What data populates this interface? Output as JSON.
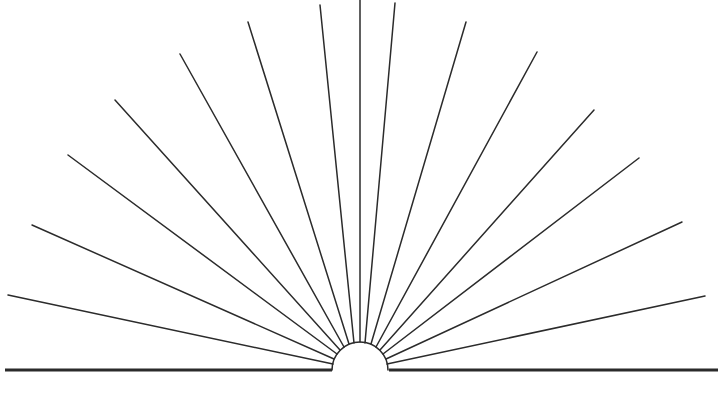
{
  "figure": {
    "name": "sunburst-fan-diagram",
    "width": 723,
    "height": 394,
    "background_color": "#ffffff",
    "stroke_color": "#2b2b2b",
    "ray_stroke_width": 1.5,
    "dome_stroke_width": 1.6,
    "baseline_stroke_width": 3.2
  },
  "baseline": {
    "label": "ground-line",
    "x_start": 5,
    "x_end": 718,
    "y": 370,
    "gap_left": 332,
    "gap_right": 389
  },
  "dome": {
    "label": "semicircle-hub",
    "center_x": 360,
    "center_y": 370,
    "radius": 28,
    "arc_start_deg": 0,
    "arc_end_deg": 180,
    "filled": false
  },
  "geometry": {
    "origin_x": 360,
    "origin_y": 370,
    "ray_count": 15,
    "angular_step_deg": 11.25,
    "angle_range_deg": [
      11.25,
      168.75
    ],
    "notes": "Rays emanate radially from the semicircle rim; outer ends are clipped by the frame."
  },
  "chart_data": {
    "type": "scatter",
    "title": "",
    "xlabel": "",
    "ylabel": "",
    "rays": [
      {
        "index": 1,
        "angle_deg": 11.25,
        "x1": 387,
        "y1": 364,
        "x2": 705,
        "y2": 296
      },
      {
        "index": 2,
        "angle_deg": 22.5,
        "x1": 386,
        "y1": 359,
        "x2": 682,
        "y2": 222
      },
      {
        "index": 3,
        "angle_deg": 33.75,
        "x1": 383,
        "y1": 354,
        "x2": 639,
        "y2": 158
      },
      {
        "index": 4,
        "angle_deg": 45.0,
        "x1": 380,
        "y1": 350,
        "x2": 594,
        "y2": 110
      },
      {
        "index": 5,
        "angle_deg": 56.25,
        "x1": 376,
        "y1": 347,
        "x2": 537,
        "y2": 52
      },
      {
        "index": 6,
        "angle_deg": 67.5,
        "x1": 371,
        "y1": 344,
        "x2": 466,
        "y2": 22
      },
      {
        "index": 7,
        "angle_deg": 78.75,
        "x1": 365,
        "y1": 343,
        "x2": 395,
        "y2": 3
      },
      {
        "index": 8,
        "angle_deg": 90.0,
        "x1": 360,
        "y1": 342,
        "x2": 360,
        "y2": 0
      },
      {
        "index": 9,
        "angle_deg": 101.25,
        "x1": 354,
        "y1": 343,
        "x2": 320,
        "y2": 5
      },
      {
        "index": 10,
        "angle_deg": 112.5,
        "x1": 349,
        "y1": 344,
        "x2": 248,
        "y2": 22
      },
      {
        "index": 11,
        "angle_deg": 123.75,
        "x1": 344,
        "y1": 347,
        "x2": 180,
        "y2": 54
      },
      {
        "index": 12,
        "angle_deg": 135.0,
        "x1": 340,
        "y1": 350,
        "x2": 115,
        "y2": 100
      },
      {
        "index": 13,
        "angle_deg": 146.25,
        "x1": 337,
        "y1": 354,
        "x2": 68,
        "y2": 155
      },
      {
        "index": 14,
        "angle_deg": 157.5,
        "x1": 334,
        "y1": 359,
        "x2": 32,
        "y2": 225
      },
      {
        "index": 15,
        "angle_deg": 168.75,
        "x1": 333,
        "y1": 364,
        "x2": 8,
        "y2": 295
      }
    ]
  }
}
